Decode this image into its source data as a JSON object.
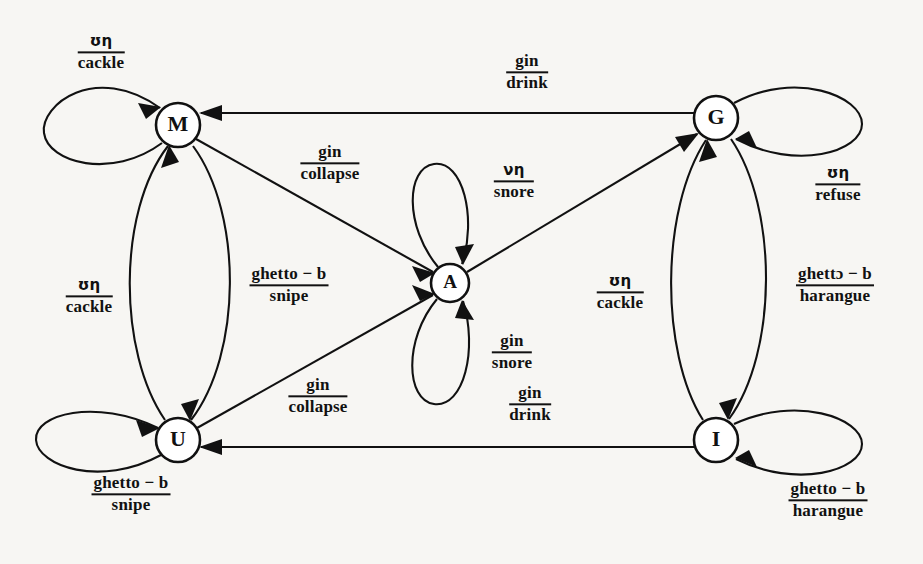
{
  "diagram": {
    "type": "state-transition-diagram",
    "background_color": "#f7f6f3",
    "stroke_color": "#111111",
    "nodes": [
      {
        "id": "M",
        "label": "M",
        "cx": 178,
        "cy": 125,
        "r": 22
      },
      {
        "id": "G",
        "label": "G",
        "cx": 716,
        "cy": 118,
        "r": 22
      },
      {
        "id": "A",
        "label": "A",
        "cx": 450,
        "cy": 283,
        "r": 19
      },
      {
        "id": "U",
        "label": "U",
        "cx": 178,
        "cy": 440,
        "r": 22
      },
      {
        "id": "I",
        "label": "I",
        "cx": 716,
        "cy": 440,
        "r": 22
      }
    ],
    "labels": [
      {
        "id": "m-self",
        "numerator": "ʊη",
        "denominator": "cackle",
        "x": 101,
        "y": 53,
        "greek": true
      },
      {
        "id": "m-to-a",
        "numerator": "gin",
        "denominator": "collapse",
        "x": 330,
        "y": 163,
        "greek": false
      },
      {
        "id": "m-u-left",
        "numerator": "ʊη",
        "denominator": "cackle",
        "x": 89,
        "y": 297,
        "greek": true
      },
      {
        "id": "m-u-right",
        "numerator": "ghetto − b",
        "denominator": "snipe",
        "x": 289,
        "y": 285,
        "greek": false
      },
      {
        "id": "a-self-top",
        "numerator": "νη",
        "denominator": "snore",
        "x": 514,
        "y": 182,
        "greek": true
      },
      {
        "id": "a-self-bot",
        "numerator": "gin",
        "denominator": "snore",
        "x": 512,
        "y": 352,
        "greek": false
      },
      {
        "id": "g-to-m",
        "numerator": "gin",
        "denominator": "drink",
        "x": 527,
        "y": 72,
        "greek": false
      },
      {
        "id": "g-self",
        "numerator": "ʊη",
        "denominator": "refuse",
        "x": 838,
        "y": 185,
        "greek": true
      },
      {
        "id": "g-i-left",
        "numerator": "ʊη",
        "denominator": "cackle",
        "x": 620,
        "y": 293,
        "greek": true
      },
      {
        "id": "g-i-right",
        "numerator": "ghettɔ − b",
        "denominator": "harangue",
        "x": 835,
        "y": 285,
        "greek": false
      },
      {
        "id": "u-to-a",
        "numerator": "gin",
        "denominator": "collapse",
        "x": 318,
        "y": 396,
        "greek": false
      },
      {
        "id": "i-to-u",
        "numerator": "gin",
        "denominator": "drink",
        "x": 530,
        "y": 404,
        "greek": false
      },
      {
        "id": "u-self",
        "numerator": "ghetto − b",
        "denominator": "snipe",
        "x": 131,
        "y": 494,
        "greek": false
      },
      {
        "id": "i-self",
        "numerator": "ghetto − b",
        "denominator": "harangue",
        "x": 828,
        "y": 500,
        "greek": false
      }
    ],
    "edges": [
      {
        "id": "m-self-loop",
        "from": "M",
        "to": "M",
        "label": "m-self",
        "kind": "self-loop-left"
      },
      {
        "id": "g-self-loop",
        "from": "G",
        "to": "G",
        "label": "g-self",
        "kind": "self-loop-right"
      },
      {
        "id": "a-self-top",
        "from": "A",
        "to": "A",
        "label": "a-self-top",
        "kind": "self-loop-up"
      },
      {
        "id": "a-self-bot",
        "from": "A",
        "to": "A",
        "label": "a-self-bot",
        "kind": "self-loop-down"
      },
      {
        "id": "u-self-loop",
        "from": "U",
        "to": "U",
        "label": "u-self",
        "kind": "self-loop-left"
      },
      {
        "id": "i-self-loop",
        "from": "I",
        "to": "I",
        "label": "i-self",
        "kind": "self-loop-right"
      },
      {
        "id": "u-to-m-arc",
        "from": "U",
        "to": "M",
        "label": "m-u-left",
        "kind": "arc-left"
      },
      {
        "id": "m-to-u-arc",
        "from": "M",
        "to": "U",
        "label": "m-u-right",
        "kind": "arc-right"
      },
      {
        "id": "i-to-g-arc",
        "from": "I",
        "to": "G",
        "label": "g-i-left",
        "kind": "arc-left"
      },
      {
        "id": "g-to-i-arc",
        "from": "G",
        "to": "I",
        "label": "g-i-right",
        "kind": "arc-right"
      },
      {
        "id": "g-to-m-line",
        "from": "G",
        "to": "M",
        "label": "g-to-m",
        "kind": "straight"
      },
      {
        "id": "i-to-u-line",
        "from": "I",
        "to": "U",
        "label": "i-to-u",
        "kind": "straight"
      },
      {
        "id": "m-to-a-line",
        "from": "M",
        "to": "A",
        "label": "m-to-a",
        "kind": "straight"
      },
      {
        "id": "u-to-a-line",
        "from": "U",
        "to": "A",
        "label": "u-to-a",
        "kind": "straight"
      },
      {
        "id": "a-to-g-line",
        "from": "A",
        "to": "G",
        "label": "g-i-left",
        "kind": "straight"
      }
    ]
  }
}
